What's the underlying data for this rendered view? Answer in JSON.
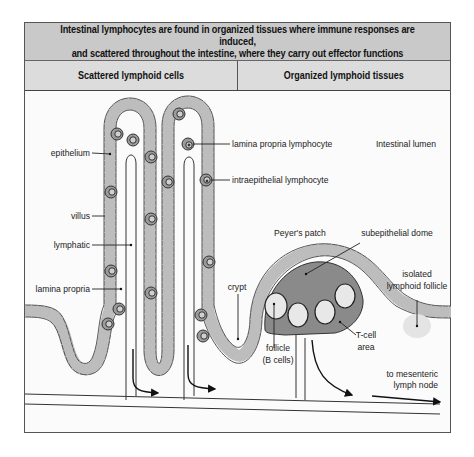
{
  "header": {
    "title": "Intestinal lymphocytes are found in organized tissues where immune responses are induced,\nand scattered throughout the intestine, where they carry out effector functions"
  },
  "columns": [
    {
      "label": "Scattered lymphoid cells"
    },
    {
      "label": "Organized lymphoid tissues"
    }
  ],
  "labels": {
    "intestinal_lumen": "Intestinal lumen",
    "epithelium": "epithelium",
    "villus": "villus",
    "lymphatic": "lymphatic",
    "lamina_propria": "lamina propria",
    "lamina_propria_lymphocyte": "lamina propria lymphocyte",
    "intraepithelial_lymphocyte": "intraepithelial lymphocyte",
    "crypt": "crypt",
    "peyers_patch": "Peyer's patch",
    "subepithelial_dome": "subepithelial dome",
    "isolated_follicle_line1": "isolated",
    "isolated_follicle_line2": "lymphoid follicle",
    "tcell_line1": "T-cell",
    "tcell_line2": "area",
    "follicle_line1": "follicle",
    "follicle_line2": "(B cells)",
    "mesenteric_line1": "to mesenteric",
    "mesenteric_line2": "lymph node"
  },
  "colors": {
    "header_bg": "#c9c9c9",
    "subheader_bg": "#dcdcdc",
    "epithelium": "#bdbdbd",
    "dome": "#8a8a8a",
    "follicle": "#e8e8e8",
    "isolated_follicle": "#e4e4e4",
    "lymphocyte": "#9a9a9a"
  }
}
